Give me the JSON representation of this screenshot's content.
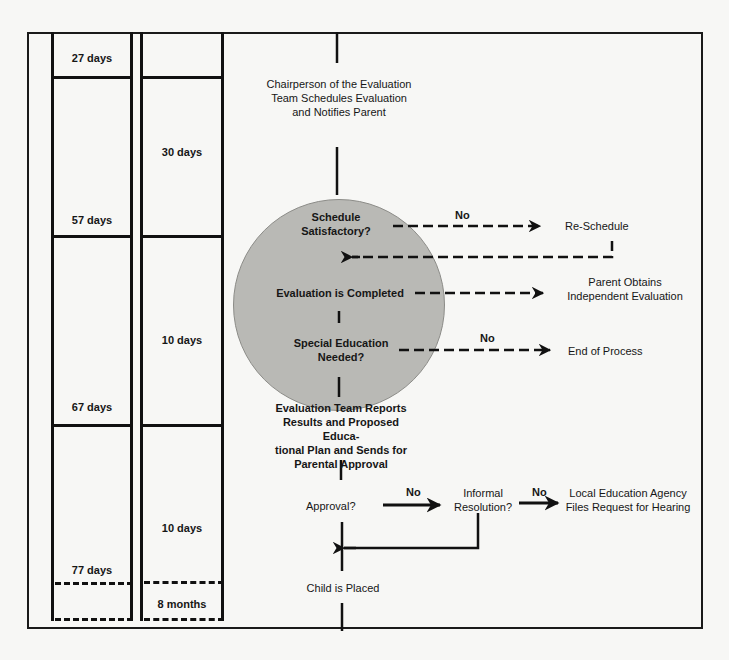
{
  "timeline": {
    "cumulative_column": {
      "cells": [
        {
          "label": "27 days"
        },
        {
          "label": "57 days"
        },
        {
          "label": "67 days"
        },
        {
          "label": "77 days"
        }
      ]
    },
    "interval_column": {
      "cells": [
        {
          "label": "30 days"
        },
        {
          "label": "10 days"
        },
        {
          "label": "10 days"
        },
        {
          "label": "8 months"
        }
      ]
    }
  },
  "flow": {
    "schedule_step": {
      "line1": "Chairperson of the Evaluation",
      "line2": "Team Schedules Evaluation",
      "line3": "and Notifies Parent"
    },
    "schedule_decision": {
      "line1": "Schedule",
      "line2": "Satisfactory?",
      "branch_label": "No",
      "target": "Re-Schedule"
    },
    "evaluation_step": {
      "label": "Evaluation is Completed",
      "target_line1": "Parent Obtains",
      "target_line2": "Independent Evaluation"
    },
    "special_ed_decision": {
      "line1": "Special Education",
      "line2": "Needed?",
      "branch_label": "No",
      "target": "End of Process"
    },
    "report_step": {
      "line1": "Evaluation Team Reports",
      "line2": "Results and Proposed Educa-",
      "line3": "tional Plan and Sends for",
      "line4": "Parental Approval"
    },
    "approval_decision": {
      "label": "Approval?",
      "branch_label": "No"
    },
    "informal_decision": {
      "line1": "Informal",
      "line2": "Resolution?",
      "branch_label": "No"
    },
    "hearing_step": {
      "line1": "Local Education Agency",
      "line2": "Files Request for Hearing"
    },
    "placed_step": {
      "label": "Child is Placed"
    }
  },
  "colors": {
    "circle_fill": "#b9b9b5",
    "line": "#111111",
    "background": "#f7f7f5"
  }
}
